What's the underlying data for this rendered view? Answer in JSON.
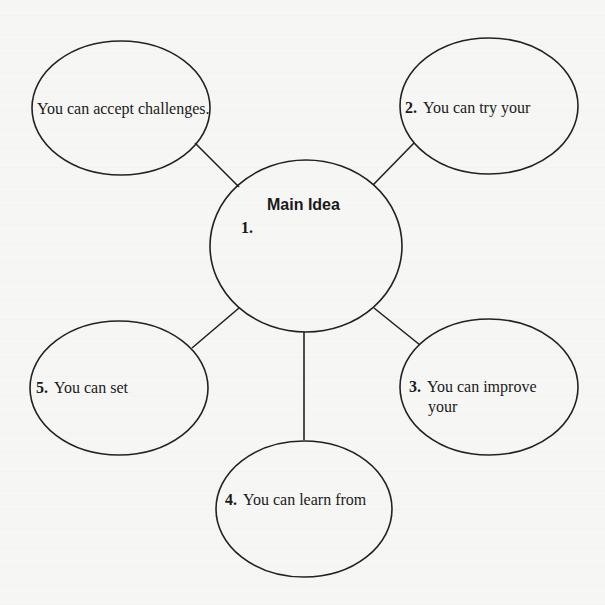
{
  "diagram": {
    "type": "idea-web",
    "center": {
      "title": "Main Idea",
      "number": "1.",
      "text": ""
    },
    "nodes": [
      {
        "id": "example",
        "number": "",
        "text": "You can accept challenges.",
        "position": "top-left"
      },
      {
        "id": "node-2",
        "number": "2.",
        "text": "You can try your",
        "position": "top-right"
      },
      {
        "id": "node-3",
        "number": "3.",
        "text": "You can improve",
        "text_line2": "your",
        "position": "bottom-right"
      },
      {
        "id": "node-4",
        "number": "4.",
        "text": "You can learn from",
        "position": "bottom"
      },
      {
        "id": "node-5",
        "number": "5.",
        "text": "You can set",
        "position": "bottom-left"
      }
    ],
    "colors": {
      "stroke": "#222222",
      "text": "#1a1a1a",
      "background": "#f6f6f4"
    }
  }
}
